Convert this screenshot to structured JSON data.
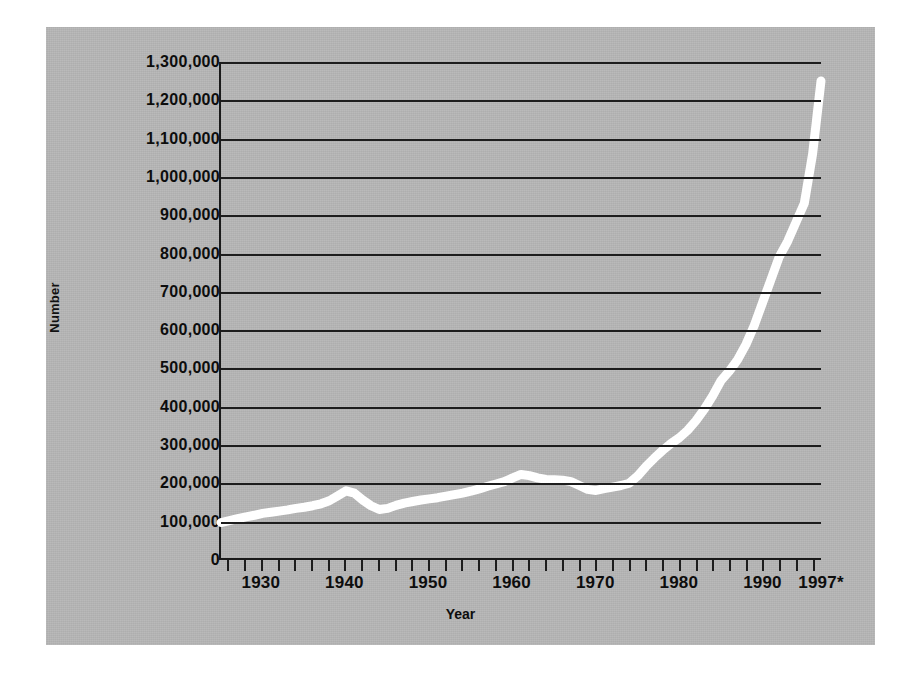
{
  "chart_data": {
    "type": "line",
    "title": "",
    "xlabel": "Year",
    "ylabel": "Number",
    "xlim": [
      1925,
      1997
    ],
    "ylim": [
      0,
      1300000
    ],
    "grid": true,
    "legend": null,
    "line_color": "#ffffff",
    "background_color": "#b7b7b7",
    "axis_color": "#1d1d1d",
    "y_ticks": [
      "1,300,000",
      "1,200,000",
      "1,100,000",
      "1,000,000",
      "900,000",
      "800,000",
      "700,000",
      "600,000",
      "500,000",
      "400,000",
      "300,000",
      "200,000",
      "100,000",
      "0"
    ],
    "y_tick_values": [
      1300000,
      1200000,
      1100000,
      1000000,
      900000,
      800000,
      700000,
      600000,
      500000,
      400000,
      300000,
      200000,
      100000,
      0
    ],
    "x_ticks": [
      "1930",
      "1940",
      "1950",
      "1960",
      "1970",
      "1980",
      "1990",
      "1997*"
    ],
    "x_tick_values": [
      1930,
      1940,
      1950,
      1960,
      1970,
      1980,
      1990,
      1997
    ],
    "x_minor_tick_interval": 2,
    "footnote_marker": "*",
    "series": [
      {
        "name": "Number",
        "x": [
          1925,
          1926,
          1927,
          1928,
          1929,
          1930,
          1931,
          1932,
          1933,
          1934,
          1935,
          1936,
          1937,
          1938,
          1939,
          1940,
          1941,
          1942,
          1943,
          1944,
          1945,
          1946,
          1947,
          1948,
          1949,
          1950,
          1951,
          1952,
          1953,
          1954,
          1955,
          1956,
          1957,
          1958,
          1959,
          1960,
          1961,
          1962,
          1963,
          1964,
          1965,
          1966,
          1967,
          1968,
          1969,
          1970,
          1971,
          1972,
          1973,
          1974,
          1975,
          1976,
          1977,
          1978,
          1979,
          1980,
          1981,
          1982,
          1983,
          1984,
          1985,
          1986,
          1987,
          1988,
          1989,
          1990,
          1991,
          1992,
          1993,
          1994,
          1995,
          1996,
          1997
        ],
        "y": [
          93000,
          98000,
          103000,
          108000,
          112000,
          117000,
          120000,
          123000,
          126000,
          130000,
          133000,
          137000,
          142000,
          150000,
          163000,
          176000,
          170000,
          152000,
          137000,
          127000,
          130000,
          138000,
          144000,
          148000,
          152000,
          155000,
          158000,
          162000,
          166000,
          170000,
          175000,
          181000,
          188000,
          194000,
          200000,
          210000,
          219000,
          216000,
          210000,
          206000,
          205000,
          204000,
          200000,
          190000,
          180000,
          177000,
          182000,
          186000,
          190000,
          196000,
          215000,
          240000,
          262000,
          282000,
          300000,
          315000,
          335000,
          360000,
          390000,
          425000,
          465000,
          490000,
          520000,
          560000,
          610000,
          670000,
          730000,
          790000,
          830000,
          880000,
          930000,
          1060000,
          1250000
        ]
      }
    ]
  },
  "axis": {
    "y_title": "Number",
    "x_title": "Year"
  }
}
